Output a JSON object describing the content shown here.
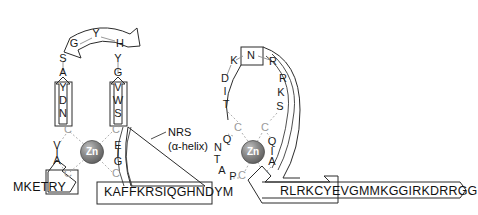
{
  "figure": {
    "metal_label": "Zn",
    "annotation": {
      "line1": "NRS",
      "line2": "(α-helix)"
    }
  },
  "colors": {
    "cysteine_text": "#9a9a9a",
    "residue_text": "#1a1a1a",
    "backbone_stroke": "#2b2b2b",
    "zinc_sphere_dark": "#6e6e6e",
    "zinc_sphere_light": "#b9b9b9",
    "zinc_text": "#ffffff",
    "bond_stroke": "#b0b0b0",
    "background": "#ffffff"
  },
  "left_finger": {
    "name": "left-zinc-finger",
    "top_arch": [
      "G",
      "Y",
      "H"
    ],
    "left_strand_upper": [
      "S",
      "A"
    ],
    "left_strand_boxed": [
      "Y",
      "D",
      "N"
    ],
    "right_strand_upper": [
      "Y",
      "G"
    ],
    "right_strand_boxed": [
      "V",
      "W",
      "S"
    ],
    "left_inner": [
      "V",
      "I",
      "A"
    ],
    "right_inner": [
      "E",
      "I",
      "G"
    ],
    "cysteines": [
      "C",
      "C",
      "C",
      "C"
    ],
    "n_term_sequence": "MKETRY",
    "helix_sequence": "KAFFKRSIQGHNDYM"
  },
  "right_finger": {
    "name": "right-zinc-finger",
    "top_arch": [
      "K",
      "N",
      "R"
    ],
    "left_strand": [
      "D",
      "I",
      "T"
    ],
    "right_strand": [
      "R",
      "K",
      "S"
    ],
    "left_inner": [
      "Q",
      "N",
      "T",
      "A",
      "P"
    ],
    "right_inner": [
      "Q",
      "I",
      "A"
    ],
    "cysteines": [
      "C",
      "C",
      "C",
      "C"
    ],
    "c_term_sequence": "RLRKCYEVGMMKGGIRKDRRGG"
  }
}
